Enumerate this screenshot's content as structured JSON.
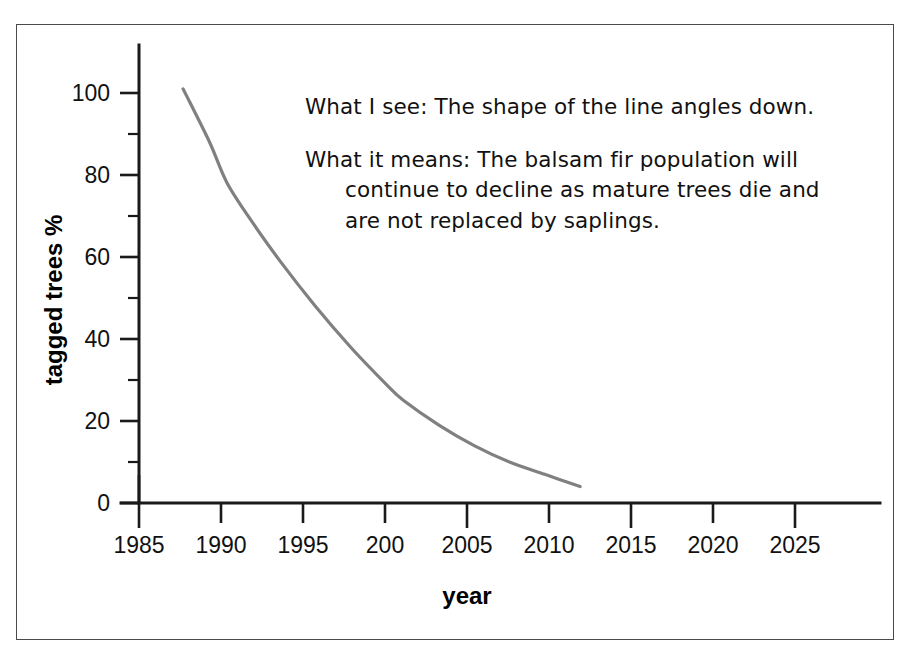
{
  "figure": {
    "background_color": "#ffffff",
    "frame_color": "#4a4a4a"
  },
  "annotation": {
    "see_label": "What I see:",
    "see_text": "What I see: The shape of the line angles down.",
    "means_line1": "What it means: The balsam fir population will",
    "means_line2": "continue to decline as mature trees die and",
    "means_line3": "are not replaced by saplings."
  },
  "chart_data": {
    "type": "line",
    "title": "",
    "xlabel": "year",
    "ylabel": "tagged trees %",
    "xlim": [
      1985,
      2027
    ],
    "ylim": [
      0,
      105
    ],
    "grid": false,
    "legend": false,
    "line_color": "#808080",
    "axis_color": "#1a1a1a",
    "x_tick_labels": [
      "1985",
      "1990",
      "1995",
      "200",
      "2005",
      "2010",
      "2015",
      "2020",
      "2025"
    ],
    "x_tick_values": [
      1985,
      1990,
      1995,
      2000,
      2005,
      2010,
      2015,
      2020,
      2025
    ],
    "y_tick_labels": [
      "0",
      "20",
      "40",
      "60",
      "80",
      "100"
    ],
    "y_tick_values": [
      0,
      20,
      40,
      60,
      80,
      100
    ],
    "y_minor_ticks": [
      10,
      30,
      50,
      70,
      90
    ],
    "series": [
      {
        "name": "tagged balsam fir",
        "x": [
          1987.5,
          1989,
          1990,
          1991.5,
          1993,
          1995,
          1997,
          1999,
          2000,
          2002,
          2004,
          2006,
          2008,
          2010
        ],
        "values": [
          101,
          88,
          78,
          68,
          59,
          48,
          38,
          29,
          25,
          19,
          14,
          10,
          7,
          4
        ]
      }
    ]
  }
}
